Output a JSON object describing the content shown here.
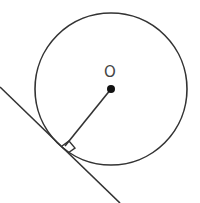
{
  "diagram": {
    "type": "circle-tangent",
    "center_label": "O",
    "colors": {
      "stroke": "#333333",
      "label": "#444444",
      "background": "#ffffff"
    },
    "circle": {
      "cx": 111,
      "cy": 89,
      "r": 76
    },
    "center_point": {
      "x": 111,
      "y": 89,
      "r": 4
    },
    "tangent_line": {
      "x1": 0,
      "y1": 87,
      "x2": 120,
      "y2": 203
    },
    "radius_segment": {
      "x1": 111,
      "y1": 89,
      "x2": 65,
      "y2": 146
    },
    "right_angle_marker": {
      "points": "62,146 69,141 75,148 68,153"
    }
  }
}
